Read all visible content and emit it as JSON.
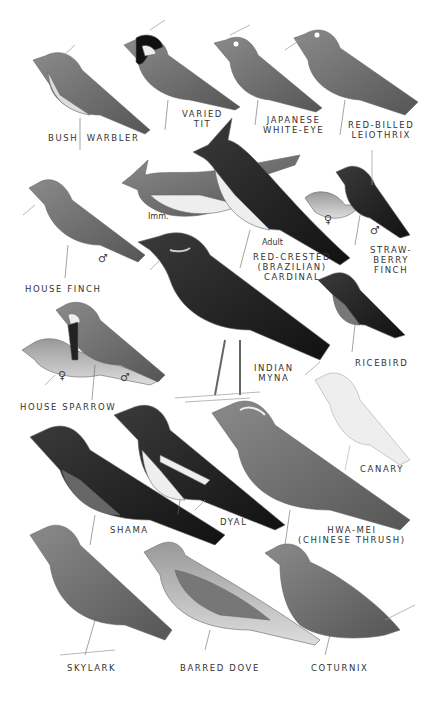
{
  "plate": {
    "birds": [
      {
        "id": "bush-warbler",
        "label": "BUSH  WARBLER"
      },
      {
        "id": "varied-tit",
        "label": "VARIED\nTIT"
      },
      {
        "id": "japanese-white-eye",
        "label": "JAPANESE\nWHITE-EYE"
      },
      {
        "id": "red-billed-leiothrix",
        "label": "RED-BILLED\nLEIOTHRIX"
      },
      {
        "id": "house-finch",
        "label": "HOUSE FINCH",
        "sex": "♂"
      },
      {
        "id": "red-crested-cardinal",
        "label": "RED-CRESTED\n(BRAZILIAN)\nCARDINAL",
        "imm": "Imm.",
        "adult": "Adult"
      },
      {
        "id": "strawberry-finch",
        "label": "STRAW-\nBERRY\nFINCH",
        "sex_female": "♀",
        "sex_male": "♂"
      },
      {
        "id": "house-sparrow",
        "label": "HOUSE SPARROW",
        "sex_female": "♀",
        "sex_male": "♂"
      },
      {
        "id": "indian-myna",
        "label": "INDIAN\nMYNA"
      },
      {
        "id": "ricebird",
        "label": "RICEBIRD"
      },
      {
        "id": "canary",
        "label": "CANARY"
      },
      {
        "id": "shama",
        "label": "SHAMA"
      },
      {
        "id": "dyal",
        "label": "DYAL"
      },
      {
        "id": "hwa-mei",
        "label": "HWA-MEI\n(CHINESE THRUSH)"
      },
      {
        "id": "skylark",
        "label": "SKYLARK"
      },
      {
        "id": "barred-dove",
        "label": "BARRED DOVE"
      },
      {
        "id": "coturnix",
        "label": "COTURNIX"
      }
    ]
  }
}
